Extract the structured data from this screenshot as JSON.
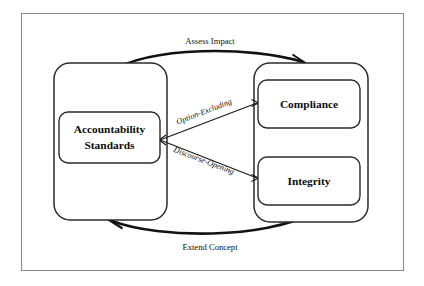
{
  "diagram": {
    "background_color": "#ffffff",
    "frame_color": "#8d8d8d",
    "line_color": "#121212",
    "text_color": "#0d0d0d",
    "nodes": [
      {
        "id": "accountability-standards",
        "label_line1": "Accountability",
        "label_line2": "Standards",
        "group": "left-container"
      },
      {
        "id": "compliance",
        "label": "Compliance",
        "group": "right-container"
      },
      {
        "id": "integrity",
        "label": "Integrity",
        "group": "right-container"
      }
    ],
    "edges": [
      {
        "id": "assess-impact",
        "label": "Assess Impact",
        "from": "left-container",
        "to": "right-container",
        "style": "curved-top",
        "arrow": "open"
      },
      {
        "id": "extend-concept",
        "label": "Extend Concept",
        "from": "right-container",
        "to": "left-container",
        "style": "curved-bottom",
        "arrow": "open"
      },
      {
        "id": "option-excluding",
        "label": "Option-Excluding",
        "from": "compliance",
        "to": "accountability-standards",
        "style": "diagonal",
        "arrow": "small-both"
      },
      {
        "id": "discourse-opening",
        "label": "Discourse-Opening",
        "from": "integrity",
        "to": "accountability-standards",
        "style": "diagonal",
        "arrow": "small-both"
      }
    ]
  }
}
